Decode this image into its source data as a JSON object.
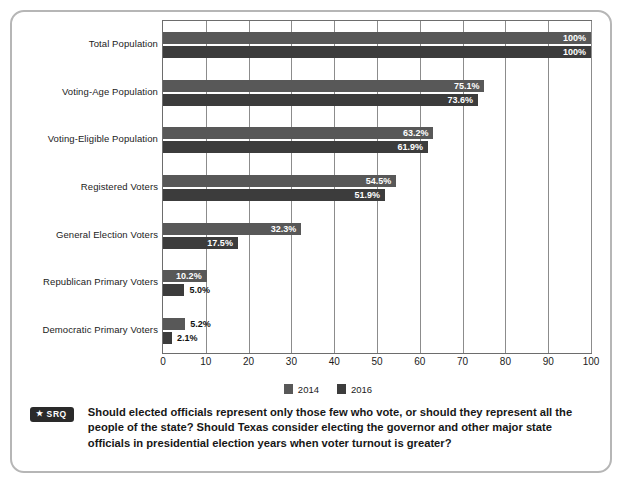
{
  "figure": {
    "border_color": "#b6b6b6"
  },
  "chart_data": {
    "type": "bar",
    "orientation": "horizontal",
    "title": "",
    "xlabel": "",
    "ylabel": "",
    "xlim": [
      0,
      100
    ],
    "xticks": [
      0,
      10,
      20,
      30,
      40,
      50,
      60,
      70,
      80,
      90,
      100
    ],
    "xtick_labels": [
      "0",
      "10",
      "20",
      "30",
      "40",
      "50",
      "60",
      "70",
      "80",
      "90",
      "100"
    ],
    "grid": true,
    "grid_axis": "x",
    "legend_position": "bottom-center",
    "categories": [
      "Total Population",
      "Voting-Age Population",
      "Voting-Eligible Population",
      "Registered Voters",
      "General Election Voters",
      "Republican Primary Voters",
      "Democratic Primary Voters"
    ],
    "series": [
      {
        "name": "2014",
        "color": "#585858",
        "values": [
          100,
          75.1,
          63.2,
          54.5,
          32.3,
          10.2,
          5.2
        ],
        "labels": [
          "100%",
          "75.1%",
          "63.2%",
          "54.5%",
          "32.3%",
          "10.2%",
          "5.2%"
        ],
        "label_inside": [
          true,
          true,
          true,
          true,
          true,
          true,
          false
        ]
      },
      {
        "name": "2016",
        "color": "#3c3c3c",
        "values": [
          100,
          73.6,
          61.9,
          51.9,
          17.5,
          5.0,
          2.1
        ],
        "labels": [
          "100%",
          "73.6%",
          "61.9%",
          "51.9%",
          "17.5%",
          "5.0%",
          "2.1%"
        ],
        "label_inside": [
          true,
          true,
          true,
          true,
          true,
          false,
          false
        ]
      }
    ]
  },
  "legend": {
    "items": [
      {
        "label": "2014",
        "color": "#585858"
      },
      {
        "label": "2016",
        "color": "#3c3c3c"
      }
    ]
  },
  "caption": {
    "badge_star": "★",
    "badge_label": "SRQ",
    "text": "Should elected officials represent only those few who vote, or should they represent all the people of the state? Should Texas consider electing the governor and other major state officials in presidential election years when voter turnout is greater?"
  }
}
